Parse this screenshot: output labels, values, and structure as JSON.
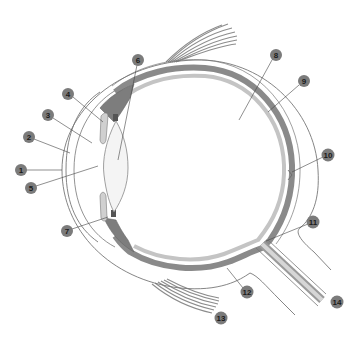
{
  "diagram": {
    "colors": {
      "background": "#ffffff",
      "outline": "#777777",
      "choroid": "#8a8a8a",
      "retina": "#b8b8b8",
      "sclera_fill": "#ffffff",
      "lens_fill": "#f2f2f2",
      "muscle": "#9a9a9a",
      "marker": "#7b7b7b",
      "marker_text": "#1a1a1a"
    },
    "labels": [
      {
        "id": 1,
        "text": "1",
        "x": 21,
        "y": 170,
        "target_x": 62,
        "target_y": 170
      },
      {
        "id": 2,
        "text": "2",
        "x": 29,
        "y": 137,
        "target_x": 70,
        "target_y": 153
      },
      {
        "id": 3,
        "text": "3",
        "x": 48,
        "y": 115,
        "target_x": 92,
        "target_y": 143
      },
      {
        "id": 4,
        "text": "4",
        "x": 68,
        "y": 94,
        "target_x": 103,
        "target_y": 122
      },
      {
        "id": 5,
        "text": "5",
        "x": 31,
        "y": 188,
        "target_x": 98,
        "target_y": 166
      },
      {
        "id": 6,
        "text": "6",
        "x": 138,
        "y": 60,
        "target_x": 118,
        "target_y": 160
      },
      {
        "id": 7,
        "text": "7",
        "x": 67,
        "y": 231,
        "target_x": 108,
        "target_y": 217
      },
      {
        "id": 8,
        "text": "8",
        "x": 276,
        "y": 55,
        "target_x": 239,
        "target_y": 120
      },
      {
        "id": 9,
        "text": "9",
        "x": 304,
        "y": 81,
        "target_x": 268,
        "target_y": 112
      },
      {
        "id": 10,
        "text": "10",
        "x": 328,
        "y": 155,
        "target_x": 292,
        "target_y": 172
      },
      {
        "id": 11,
        "text": "11",
        "x": 313,
        "y": 222,
        "target_x": 266,
        "target_y": 241
      },
      {
        "id": 12,
        "text": "12",
        "x": 247,
        "y": 292,
        "target_x": 227,
        "target_y": 268
      },
      {
        "id": 13,
        "text": "13",
        "x": 221,
        "y": 318,
        "target_x": 210,
        "target_y": 311
      },
      {
        "id": 14,
        "text": "14",
        "x": 337,
        "y": 302,
        "target_x": 327,
        "target_y": 300
      }
    ]
  }
}
